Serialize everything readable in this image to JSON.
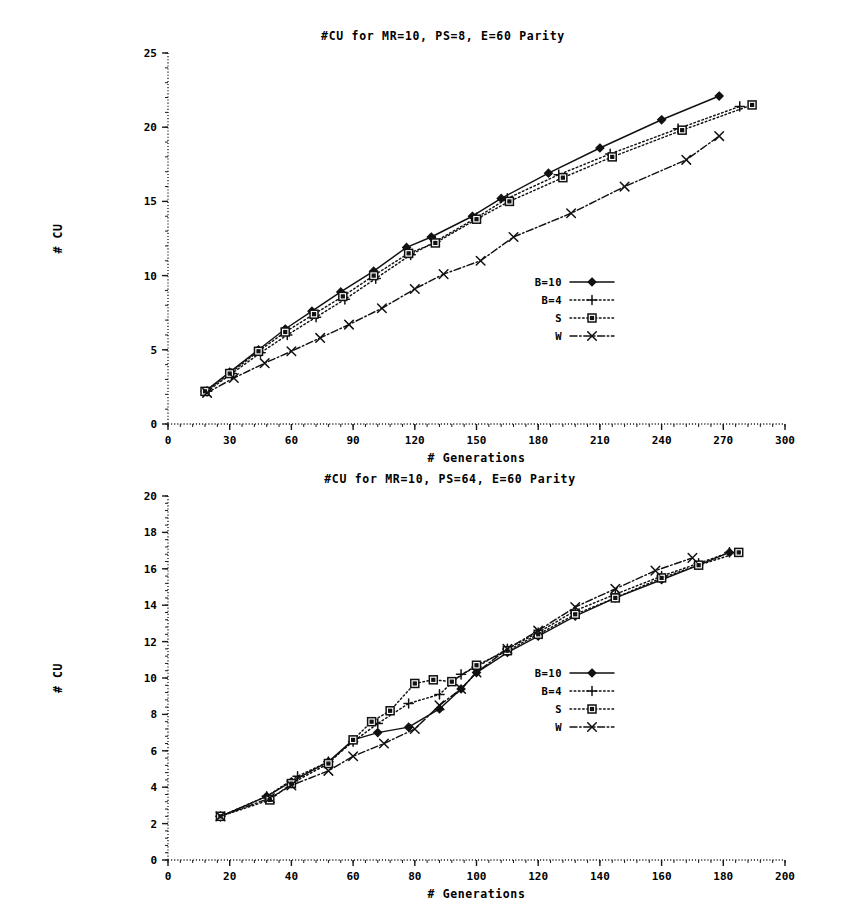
{
  "page": {
    "background_color": "#ffffff",
    "ink_color": "#111111"
  },
  "figures": [
    {
      "id": "figure-1",
      "title": "#CU for MR=10, PS=8, E=60 Parity",
      "xlabel": "# Generations",
      "ylabel": "# CU"
    },
    {
      "id": "figure-2",
      "title": "#CU for MR=10, PS=64, E=60 Parity",
      "xlabel": "# Generations",
      "ylabel": "# CU"
    }
  ],
  "chart_data": [
    {
      "type": "line",
      "title": "#CU for MR=10, PS=8, E=60 Parity",
      "xlabel": "# Generations",
      "ylabel": "# CU",
      "xlim": [
        0,
        300
      ],
      "ylim": [
        0,
        25
      ],
      "xticks": [
        0,
        30,
        60,
        90,
        120,
        150,
        180,
        210,
        240,
        270,
        300
      ],
      "yticks": [
        0,
        5,
        10,
        15,
        20,
        25
      ],
      "xtick_labels": [
        "0",
        "30",
        "60",
        "90",
        "120",
        "150",
        "180",
        "210",
        "240",
        "270",
        "300"
      ],
      "ytick_labels": [
        "0",
        "5",
        "10",
        "15",
        "20",
        "25"
      ],
      "grid": false,
      "legend_position": "center-right",
      "series": [
        {
          "name": "B=10",
          "marker": "filled-diamond",
          "linestyle": "solid",
          "points": [
            [
              18,
              2.2
            ],
            [
              30,
              3.5
            ],
            [
              44,
              5.0
            ],
            [
              57,
              6.4
            ],
            [
              70,
              7.6
            ],
            [
              84,
              8.9
            ],
            [
              100,
              10.3
            ],
            [
              116,
              11.9
            ],
            [
              128,
              12.6
            ],
            [
              148,
              14.0
            ],
            [
              162,
              15.2
            ],
            [
              185,
              16.9
            ],
            [
              210,
              18.6
            ],
            [
              240,
              20.5
            ],
            [
              268,
              22.1
            ]
          ]
        },
        {
          "name": "B=4",
          "marker": "plus",
          "linestyle": "dotted",
          "points": [
            [
              19,
              2.2
            ],
            [
              31,
              3.4
            ],
            [
              45,
              4.8
            ],
            [
              58,
              6.0
            ],
            [
              72,
              7.2
            ],
            [
              86,
              8.4
            ],
            [
              101,
              9.8
            ],
            [
              118,
              11.4
            ],
            [
              130,
              12.3
            ],
            [
              150,
              13.9
            ],
            [
              165,
              15.2
            ],
            [
              190,
              16.8
            ],
            [
              215,
              18.2
            ],
            [
              248,
              19.9
            ],
            [
              278,
              21.4
            ]
          ]
        },
        {
          "name": "S",
          "marker": "open-square",
          "linestyle": "dotted",
          "points": [
            [
              18,
              2.2
            ],
            [
              30,
              3.4
            ],
            [
              44,
              4.9
            ],
            [
              57,
              6.2
            ],
            [
              71,
              7.4
            ],
            [
              85,
              8.6
            ],
            [
              100,
              10.0
            ],
            [
              117,
              11.5
            ],
            [
              130,
              12.2
            ],
            [
              150,
              13.8
            ],
            [
              166,
              15.0
            ],
            [
              192,
              16.6
            ],
            [
              216,
              18.0
            ],
            [
              250,
              19.8
            ],
            [
              284,
              21.5
            ]
          ]
        },
        {
          "name": "W",
          "marker": "cross",
          "linestyle": "dash-dot",
          "points": [
            [
              19,
              2.1
            ],
            [
              32,
              3.1
            ],
            [
              47,
              4.1
            ],
            [
              60,
              4.9
            ],
            [
              74,
              5.8
            ],
            [
              88,
              6.7
            ],
            [
              104,
              7.8
            ],
            [
              120,
              9.1
            ],
            [
              134,
              10.1
            ],
            [
              152,
              11.0
            ],
            [
              168,
              12.6
            ],
            [
              196,
              14.2
            ],
            [
              222,
              16.0
            ],
            [
              252,
              17.8
            ],
            [
              268,
              19.4
            ]
          ]
        }
      ]
    },
    {
      "type": "line",
      "title": "#CU for MR=10, PS=64, E=60 Parity",
      "xlabel": "# Generations",
      "ylabel": "# CU",
      "xlim": [
        0,
        200
      ],
      "ylim": [
        0,
        20
      ],
      "xticks": [
        0,
        20,
        40,
        60,
        80,
        100,
        120,
        140,
        160,
        180,
        200
      ],
      "yticks": [
        0,
        2,
        4,
        6,
        8,
        10,
        12,
        14,
        16,
        18,
        20
      ],
      "xtick_labels": [
        "0",
        "20",
        "40",
        "60",
        "80",
        "100",
        "120",
        "140",
        "160",
        "180",
        "200"
      ],
      "ytick_labels": [
        "0",
        "2",
        "4",
        "6",
        "8",
        "10",
        "12",
        "14",
        "16",
        "18",
        "20"
      ],
      "grid": false,
      "legend_position": "center-right",
      "series": [
        {
          "name": "B=10",
          "marker": "filled-diamond",
          "linestyle": "solid",
          "points": [
            [
              17,
              2.4
            ],
            [
              32,
              3.5
            ],
            [
              40,
              4.3
            ],
            [
              52,
              5.4
            ],
            [
              60,
              6.6
            ],
            [
              68,
              7.0
            ],
            [
              78,
              7.3
            ],
            [
              88,
              8.3
            ],
            [
              95,
              9.4
            ],
            [
              100,
              10.3
            ],
            [
              110,
              11.4
            ],
            [
              120,
              12.3
            ],
            [
              132,
              13.4
            ],
            [
              145,
              14.4
            ],
            [
              160,
              15.4
            ],
            [
              172,
              16.2
            ],
            [
              182,
              16.9
            ]
          ]
        },
        {
          "name": "B=4",
          "marker": "plus",
          "linestyle": "dotted",
          "points": [
            [
              17,
              2.4
            ],
            [
              32,
              3.5
            ],
            [
              42,
              4.6
            ],
            [
              52,
              5.4
            ],
            [
              60,
              6.5
            ],
            [
              68,
              7.5
            ],
            [
              78,
              8.6
            ],
            [
              88,
              9.1
            ],
            [
              95,
              10.2
            ],
            [
              100,
              10.6
            ],
            [
              110,
              11.6
            ],
            [
              120,
              12.5
            ],
            [
              132,
              13.7
            ],
            [
              145,
              14.6
            ],
            [
              160,
              15.6
            ],
            [
              172,
              16.3
            ],
            [
              182,
              16.9
            ]
          ]
        },
        {
          "name": "S",
          "marker": "open-square",
          "linestyle": "dotted",
          "points": [
            [
              17,
              2.4
            ],
            [
              33,
              3.3
            ],
            [
              40,
              4.2
            ],
            [
              52,
              5.3
            ],
            [
              60,
              6.6
            ],
            [
              66,
              7.6
            ],
            [
              72,
              8.2
            ],
            [
              80,
              9.7
            ],
            [
              86,
              9.9
            ],
            [
              92,
              9.8
            ],
            [
              100,
              10.7
            ],
            [
              110,
              11.5
            ],
            [
              120,
              12.4
            ],
            [
              132,
              13.5
            ],
            [
              145,
              14.4
            ],
            [
              160,
              15.5
            ],
            [
              172,
              16.2
            ],
            [
              185,
              16.9
            ]
          ]
        },
        {
          "name": "W",
          "marker": "cross",
          "linestyle": "dash-dot",
          "points": [
            [
              17,
              2.4
            ],
            [
              33,
              3.4
            ],
            [
              40,
              4.1
            ],
            [
              52,
              4.9
            ],
            [
              60,
              5.7
            ],
            [
              70,
              6.4
            ],
            [
              80,
              7.2
            ],
            [
              88,
              8.5
            ],
            [
              95,
              9.4
            ],
            [
              100,
              10.3
            ],
            [
              110,
              11.6
            ],
            [
              120,
              12.6
            ],
            [
              132,
              13.9
            ],
            [
              145,
              14.9
            ],
            [
              158,
              15.9
            ],
            [
              170,
              16.6
            ]
          ]
        }
      ]
    }
  ],
  "legend": {
    "entries": [
      {
        "label": "B=10",
        "marker": "filled-diamond",
        "linestyle": "solid"
      },
      {
        "label": "B=4",
        "marker": "plus",
        "linestyle": "dotted"
      },
      {
        "label": "S",
        "marker": "open-square",
        "linestyle": "dotted"
      },
      {
        "label": "W",
        "marker": "cross",
        "linestyle": "dash-dot"
      }
    ]
  }
}
